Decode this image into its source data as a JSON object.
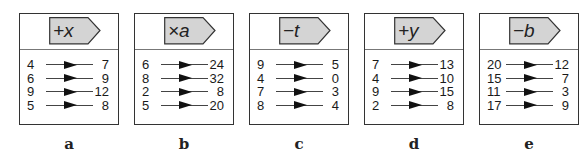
{
  "machines": [
    {
      "caption": "a",
      "operation": "+x",
      "rows": [
        {
          "input": "4",
          "output": "7"
        },
        {
          "input": "6",
          "output": "9"
        },
        {
          "input": "9",
          "output": "12"
        },
        {
          "input": "5",
          "output": "8"
        }
      ]
    },
    {
      "caption": "b",
      "operation": "×a",
      "rows": [
        {
          "input": "6",
          "output": "24"
        },
        {
          "input": "8",
          "output": "32"
        },
        {
          "input": "2",
          "output": "8"
        },
        {
          "input": "5",
          "output": "20"
        }
      ]
    },
    {
      "caption": "c",
      "operation": "−t",
      "rows": [
        {
          "input": "9",
          "output": "5"
        },
        {
          "input": "4",
          "output": "0"
        },
        {
          "input": "7",
          "output": "3"
        },
        {
          "input": "8",
          "output": "4"
        }
      ]
    },
    {
      "caption": "d",
      "operation": "+y",
      "rows": [
        {
          "input": "7",
          "output": "13"
        },
        {
          "input": "4",
          "output": "10"
        },
        {
          "input": "9",
          "output": "15"
        },
        {
          "input": "2",
          "output": "8"
        }
      ]
    },
    {
      "caption": "e",
      "operation": "−b",
      "rows": [
        {
          "input": "20",
          "output": "12"
        },
        {
          "input": "15",
          "output": "7"
        },
        {
          "input": "11",
          "output": "3"
        },
        {
          "input": "17",
          "output": "9"
        }
      ]
    }
  ],
  "colors": {
    "tag_fill": "#d4d4d4",
    "border": "#333333"
  }
}
